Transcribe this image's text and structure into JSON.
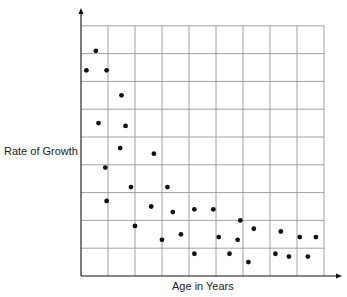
{
  "chart_data": {
    "type": "scatter",
    "title": "",
    "xlabel": "Age in Years",
    "ylabel": "Rate of Growth",
    "grid": true,
    "x_tick_labels": [],
    "y_tick_labels": [],
    "grid_cols": 9,
    "grid_rows": 9,
    "xlim": [
      0,
      9
    ],
    "ylim": [
      0,
      9
    ],
    "points": [
      {
        "x": 0.2,
        "y": 7.4
      },
      {
        "x": 0.55,
        "y": 8.1
      },
      {
        "x": 0.95,
        "y": 7.4
      },
      {
        "x": 1.5,
        "y": 6.5
      },
      {
        "x": 0.65,
        "y": 5.5
      },
      {
        "x": 1.65,
        "y": 5.4
      },
      {
        "x": 1.45,
        "y": 4.6
      },
      {
        "x": 2.7,
        "y": 4.4
      },
      {
        "x": 0.9,
        "y": 3.9
      },
      {
        "x": 1.85,
        "y": 3.2
      },
      {
        "x": 3.2,
        "y": 3.2
      },
      {
        "x": 0.95,
        "y": 2.7
      },
      {
        "x": 2.6,
        "y": 2.5
      },
      {
        "x": 3.4,
        "y": 2.3
      },
      {
        "x": 4.2,
        "y": 2.4
      },
      {
        "x": 4.9,
        "y": 2.4
      },
      {
        "x": 2.0,
        "y": 1.8
      },
      {
        "x": 3.0,
        "y": 1.3
      },
      {
        "x": 3.7,
        "y": 1.5
      },
      {
        "x": 4.2,
        "y": 0.8
      },
      {
        "x": 5.9,
        "y": 2.0
      },
      {
        "x": 5.1,
        "y": 1.4
      },
      {
        "x": 5.8,
        "y": 1.3
      },
      {
        "x": 6.4,
        "y": 1.7
      },
      {
        "x": 7.4,
        "y": 1.6
      },
      {
        "x": 8.1,
        "y": 1.4
      },
      {
        "x": 5.5,
        "y": 0.8
      },
      {
        "x": 6.2,
        "y": 0.5
      },
      {
        "x": 7.2,
        "y": 0.8
      },
      {
        "x": 7.7,
        "y": 0.7
      },
      {
        "x": 8.4,
        "y": 0.7
      },
      {
        "x": 8.7,
        "y": 1.4
      }
    ]
  },
  "labels": {
    "x": "Age in Years",
    "y": "Rate of Growth"
  }
}
